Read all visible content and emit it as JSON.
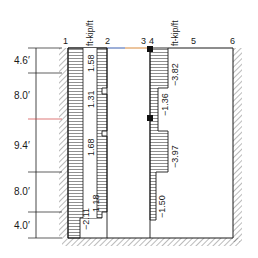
{
  "diagram": {
    "node_labels": [
      "1",
      "2",
      "3",
      "4",
      "5",
      "6"
    ],
    "unit_labels": [
      "ft-kip/ft",
      "ft-kip/ft"
    ],
    "dimensions": [
      "4.6′",
      "8.0′",
      "9.4′",
      "8.0′",
      "4.0′"
    ],
    "dimension_values_ft": [
      4.6,
      8.0,
      9.4,
      8.0,
      4.0
    ],
    "left_panel_values": [
      "1.58",
      "1.31",
      "1.68",
      "1.18",
      "−2.11"
    ],
    "right_panel_values": [
      "−3.82",
      "−1.36",
      "−3.97",
      "−1.50"
    ],
    "colors": {
      "line": "#1a1a1a",
      "accent_blue": "#3a5fb0",
      "accent_orange": "#d98a3a",
      "accent_red": "#d04040"
    }
  }
}
